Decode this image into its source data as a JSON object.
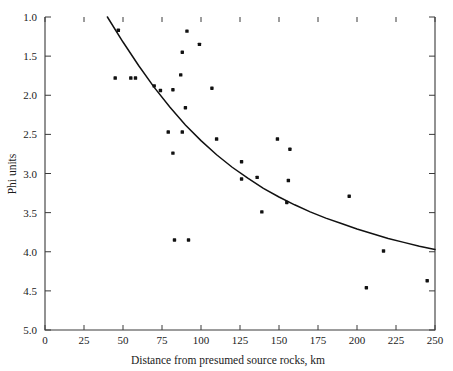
{
  "chart_data": {
    "type": "scatter",
    "title": "",
    "xlabel": "Distance from presumed source rocks, km",
    "ylabel": "Phi units",
    "xlim": [
      0,
      250
    ],
    "ylim": [
      1.0,
      5.0
    ],
    "y_inverted": true,
    "grid": false,
    "legend": null,
    "xticks": [
      0,
      25,
      50,
      75,
      100,
      125,
      150,
      175,
      200,
      225,
      250
    ],
    "xtick_labels": [
      "0",
      "25",
      "50",
      "75",
      "100",
      "125",
      "150",
      "175",
      "200",
      "225",
      "250"
    ],
    "yticks": [
      1.0,
      1.5,
      2.0,
      2.5,
      3.0,
      3.5,
      4.0,
      4.5,
      5.0
    ],
    "ytick_labels": [
      "1.0",
      "1.5",
      "2.0",
      "2.5",
      "3.0",
      "3.5",
      "4.0",
      "4.5",
      "5.0"
    ],
    "points": [
      {
        "x": 47,
        "y": 1.17
      },
      {
        "x": 45,
        "y": 1.78
      },
      {
        "x": 55,
        "y": 1.78
      },
      {
        "x": 58,
        "y": 1.78
      },
      {
        "x": 70,
        "y": 1.88
      },
      {
        "x": 74,
        "y": 1.94
      },
      {
        "x": 91,
        "y": 1.18
      },
      {
        "x": 99,
        "y": 1.35
      },
      {
        "x": 88,
        "y": 1.45
      },
      {
        "x": 87,
        "y": 1.74
      },
      {
        "x": 82,
        "y": 1.93
      },
      {
        "x": 107,
        "y": 1.91
      },
      {
        "x": 90,
        "y": 2.16
      },
      {
        "x": 79,
        "y": 2.47
      },
      {
        "x": 88,
        "y": 2.47
      },
      {
        "x": 82,
        "y": 2.74
      },
      {
        "x": 110,
        "y": 2.56
      },
      {
        "x": 83,
        "y": 3.85
      },
      {
        "x": 92,
        "y": 3.85
      },
      {
        "x": 126,
        "y": 2.85
      },
      {
        "x": 136,
        "y": 3.05
      },
      {
        "x": 149,
        "y": 2.56
      },
      {
        "x": 157,
        "y": 2.69
      },
      {
        "x": 156,
        "y": 3.09
      },
      {
        "x": 126,
        "y": 3.07
      },
      {
        "x": 139,
        "y": 3.49
      },
      {
        "x": 155,
        "y": 3.37
      },
      {
        "x": 195,
        "y": 3.29
      },
      {
        "x": 217,
        "y": 3.99
      },
      {
        "x": 206,
        "y": 4.46
      },
      {
        "x": 245,
        "y": 4.37
      }
    ],
    "trend_curve": {
      "label": "fitted decay curve",
      "points": [
        {
          "x": 40,
          "y": 1.0
        },
        {
          "x": 50,
          "y": 1.32
        },
        {
          "x": 60,
          "y": 1.62
        },
        {
          "x": 70,
          "y": 1.9
        },
        {
          "x": 80,
          "y": 2.15
        },
        {
          "x": 90,
          "y": 2.38
        },
        {
          "x": 100,
          "y": 2.58
        },
        {
          "x": 110,
          "y": 2.76
        },
        {
          "x": 120,
          "y": 2.92
        },
        {
          "x": 130,
          "y": 3.06
        },
        {
          "x": 140,
          "y": 3.19
        },
        {
          "x": 150,
          "y": 3.3
        },
        {
          "x": 160,
          "y": 3.4
        },
        {
          "x": 170,
          "y": 3.49
        },
        {
          "x": 180,
          "y": 3.57
        },
        {
          "x": 190,
          "y": 3.64
        },
        {
          "x": 200,
          "y": 3.71
        },
        {
          "x": 210,
          "y": 3.77
        },
        {
          "x": 220,
          "y": 3.83
        },
        {
          "x": 230,
          "y": 3.88
        },
        {
          "x": 240,
          "y": 3.93
        },
        {
          "x": 250,
          "y": 3.97
        }
      ]
    }
  },
  "figure": {
    "cropped_top_text": ""
  }
}
